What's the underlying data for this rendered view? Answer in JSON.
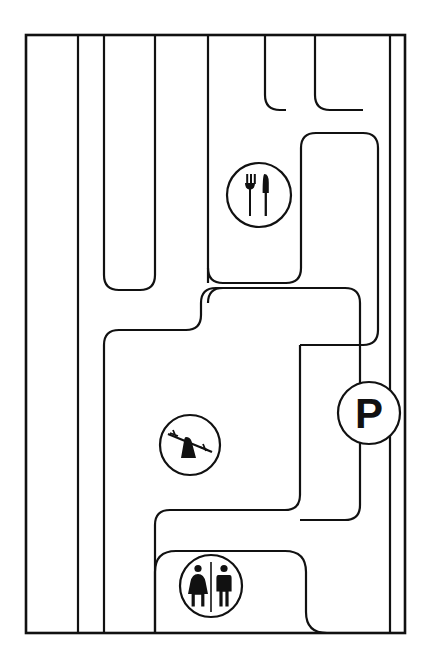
{
  "map": {
    "title": "Facility Site Map",
    "style": "line-art",
    "background_color": "#ffffff",
    "line_color": "#111111",
    "frame": {
      "x": 26,
      "y": 35,
      "width": 379,
      "height": 598
    },
    "icons": [
      {
        "id": "restaurant",
        "name": "restaurant-icon",
        "label": "Restaurant",
        "glyph": "fork-and-knife",
        "cx": 259,
        "cy": 195,
        "r": 32
      },
      {
        "id": "playground",
        "name": "playground-icon",
        "label": "Playground",
        "glyph": "seesaw",
        "cx": 190,
        "cy": 445,
        "r": 30
      },
      {
        "id": "parking",
        "name": "parking-icon",
        "label": "Parking",
        "glyph": "letter-P",
        "text": "P",
        "cx": 369,
        "cy": 413,
        "r": 31
      },
      {
        "id": "restrooms",
        "name": "restrooms-icon",
        "label": "Restrooms",
        "glyph": "man-and-woman",
        "cx": 211,
        "cy": 586,
        "r": 31
      }
    ],
    "legend": [
      {
        "symbol": "fork-and-knife",
        "label": "Restaurant"
      },
      {
        "symbol": "seesaw",
        "label": "Playground"
      },
      {
        "symbol": "P",
        "label": "Parking"
      },
      {
        "symbol": "man-and-woman",
        "label": "Restrooms"
      }
    ]
  }
}
